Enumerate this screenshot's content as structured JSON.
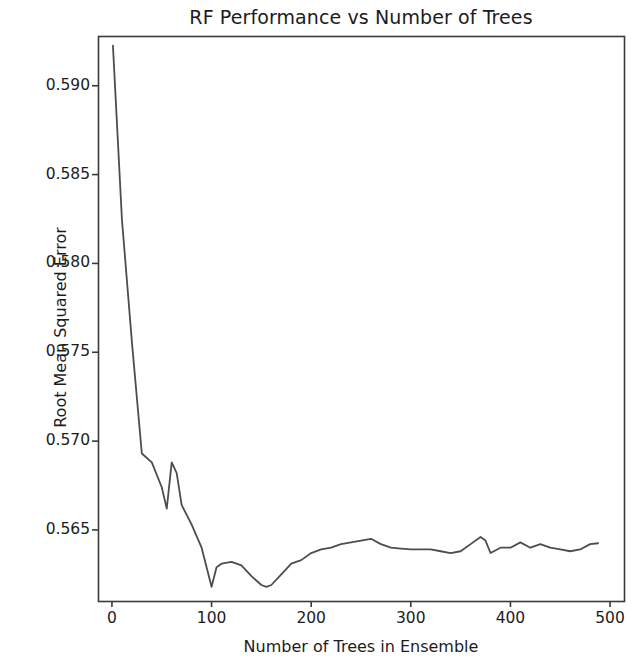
{
  "chart_data": {
    "type": "line",
    "title": "RF Performance vs Number of Trees",
    "xlabel": "Number of Trees in Ensemble",
    "ylabel": "Root Mean Squared Error",
    "xlim": [
      -14,
      514
    ],
    "ylim": [
      0.561,
      0.5928
    ],
    "xticks": [
      0,
      100,
      200,
      300,
      400,
      500
    ],
    "xtick_labels": [
      "0",
      "100",
      "200",
      "300",
      "400",
      "500"
    ],
    "yticks": [
      0.565,
      0.57,
      0.575,
      0.58,
      0.585,
      0.59
    ],
    "ytick_labels": [
      "0.565",
      "0.570",
      "0.575",
      "0.580",
      "0.585",
      "0.590"
    ],
    "grid": false,
    "legend": null,
    "line_color": "#4d4d4d",
    "line_width": 1.8,
    "series": [
      {
        "name": "Root Mean Squared Error",
        "x": [
          1,
          10,
          20,
          30,
          40,
          50,
          55,
          60,
          65,
          70,
          80,
          90,
          100,
          105,
          110,
          120,
          130,
          140,
          150,
          155,
          160,
          170,
          180,
          190,
          200,
          210,
          220,
          230,
          240,
          250,
          260,
          270,
          280,
          290,
          300,
          310,
          320,
          330,
          340,
          350,
          360,
          370,
          375,
          380,
          390,
          400,
          410,
          420,
          430,
          440,
          450,
          460,
          470,
          480,
          488
        ],
        "y": [
          0.59225,
          0.5825,
          0.5756,
          0.5693,
          0.5688,
          0.5674,
          0.5662,
          0.5688,
          0.5682,
          0.5664,
          0.5653,
          0.564,
          0.5618,
          0.5629,
          0.5631,
          0.5632,
          0.563,
          0.5624,
          0.5619,
          0.5618,
          0.5619,
          0.5625,
          0.5631,
          0.5633,
          0.5637,
          0.5639,
          0.564,
          0.5642,
          0.5643,
          0.5644,
          0.5645,
          0.5642,
          0.564,
          0.56395,
          0.5639,
          0.5639,
          0.5639,
          0.5638,
          0.5637,
          0.5638,
          0.5642,
          0.5646,
          0.5644,
          0.5637,
          0.564,
          0.564,
          0.5643,
          0.564,
          0.5642,
          0.564,
          0.5639,
          0.5638,
          0.5639,
          0.5642,
          0.56425
        ]
      }
    ],
    "axes_pixel_box": {
      "left": 98,
      "top": 36,
      "right": 624,
      "bottom": 601
    }
  }
}
